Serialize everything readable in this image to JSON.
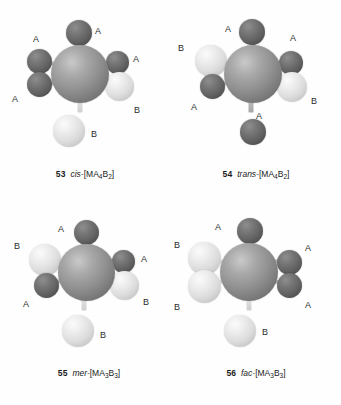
{
  "figure": {
    "background_color": "#ffffff",
    "atom_colors": {
      "metal": "#8f8f8f",
      "ligand_a": "#616161",
      "ligand_b": "#dcdcdc"
    },
    "structures": [
      {
        "number": "53",
        "prefix": "cis-",
        "formula_open": "[MA",
        "sub1": "4",
        "mid": "B",
        "sub2": "2",
        "formula_close": "]",
        "center_label": "M",
        "vertices": [
          {
            "position": "top",
            "label": "A",
            "type": "a"
          },
          {
            "position": "upper-left",
            "label": "A",
            "type": "a"
          },
          {
            "position": "lower-left",
            "label": "A",
            "type": "a"
          },
          {
            "position": "upper-right",
            "label": "A",
            "type": "a"
          },
          {
            "position": "lower-right",
            "label": "B",
            "type": "b"
          },
          {
            "position": "bottom",
            "label": "B",
            "type": "b"
          }
        ]
      },
      {
        "number": "54",
        "prefix": "trans-",
        "formula_open": "[MA",
        "sub1": "4",
        "mid": "B",
        "sub2": "2",
        "formula_close": "]",
        "center_label": "M",
        "vertices": [
          {
            "position": "top",
            "label": "A",
            "type": "a"
          },
          {
            "position": "upper-left",
            "label": "B",
            "type": "b"
          },
          {
            "position": "lower-left",
            "label": "A",
            "type": "a"
          },
          {
            "position": "upper-right",
            "label": "A",
            "type": "a"
          },
          {
            "position": "lower-right",
            "label": "B",
            "type": "b"
          },
          {
            "position": "bottom",
            "label": "A",
            "type": "a"
          }
        ]
      },
      {
        "number": "55",
        "prefix": "mer-",
        "formula_open": "[MA",
        "sub1": "3",
        "mid": "B",
        "sub2": "3",
        "formula_close": "]",
        "center_label": "M",
        "vertices": [
          {
            "position": "top",
            "label": "A",
            "type": "a"
          },
          {
            "position": "upper-left",
            "label": "B",
            "type": "b"
          },
          {
            "position": "lower-left",
            "label": "A",
            "type": "a"
          },
          {
            "position": "upper-right",
            "label": "A",
            "type": "a"
          },
          {
            "position": "lower-right",
            "label": "B",
            "type": "b"
          },
          {
            "position": "bottom",
            "label": "B",
            "type": "b"
          }
        ]
      },
      {
        "number": "56",
        "prefix": "fac-",
        "formula_open": "[MA",
        "sub1": "3",
        "mid": "B",
        "sub2": "3",
        "formula_close": "]",
        "center_label": "M",
        "vertices": [
          {
            "position": "top",
            "label": "A",
            "type": "a"
          },
          {
            "position": "upper-left",
            "label": "B",
            "type": "b"
          },
          {
            "position": "lower-left",
            "label": "B",
            "type": "b"
          },
          {
            "position": "upper-right",
            "label": "A",
            "type": "a"
          },
          {
            "position": "lower-right",
            "label": "A",
            "type": "a"
          },
          {
            "position": "bottom",
            "label": "B",
            "type": "b"
          }
        ]
      }
    ]
  }
}
